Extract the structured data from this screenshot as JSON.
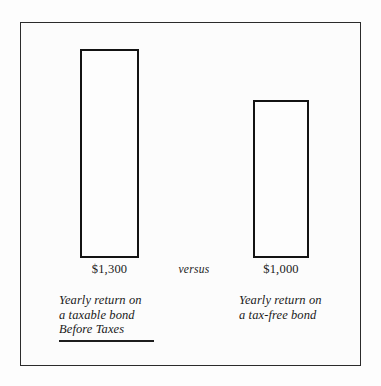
{
  "figure": {
    "frame_visible": true,
    "background_color": "#fcfcfc",
    "outline_color": "#2b2b2b"
  },
  "labels": {
    "versus": "versus",
    "taxable_value": "$1,300",
    "taxfree_value": "$1,000",
    "taxable_caption_line1": "Yearly return on",
    "taxable_caption_line2": "a taxable bond",
    "taxable_caption_line3": "Before Taxes",
    "taxfree_caption_line1": "Yearly return on",
    "taxfree_caption_line2": "a tax-free bond"
  },
  "chart_data": {
    "type": "bar",
    "title": "",
    "subtitle": "",
    "xlabel": "",
    "ylabel": "",
    "categories": [
      "Yearly return on a taxable bond Before Taxes",
      "Yearly return on a tax-free bond"
    ],
    "values": [
      1300,
      1000
    ],
    "value_labels": [
      "$1,300",
      "$1,000"
    ],
    "units": "USD",
    "ylim": [
      0,
      1430
    ],
    "grid": false,
    "legend": null,
    "bar_style": {
      "fill": "#fdfdfd",
      "edge_color": "#131313",
      "edge_width": 2.5
    },
    "annotations": [
      {
        "text": "versus",
        "position": "between-bars",
        "style": "italic"
      },
      {
        "text": "Before Taxes",
        "style": "italic-underlined",
        "attached_to": "Yearly return on a taxable bond"
      }
    ]
  }
}
